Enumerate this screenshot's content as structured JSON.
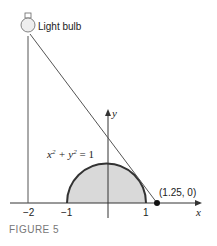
{
  "figure": {
    "caption": "FIGURE 5",
    "light_label": "Light bulb",
    "equation_lhs": "x",
    "equation_mid": " + y",
    "equation_rhs": " = 1",
    "eq_exp": "2",
    "point_label": "(1.25, 0)",
    "x_axis_label": "x",
    "y_axis_label": "y",
    "x_ticks": [
      "−2",
      "−1",
      "1"
    ],
    "colors": {
      "fill": "#d9d9d9",
      "stroke": "#333333",
      "line": "#555555"
    }
  }
}
